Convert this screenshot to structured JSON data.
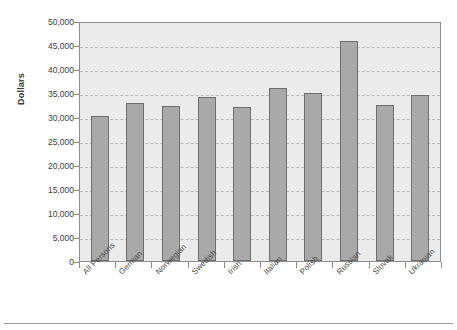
{
  "chart_data": {
    "type": "bar",
    "title": "",
    "subtitle": "",
    "xlabel": "",
    "ylabel": "Dollars",
    "ylim": [
      0,
      50000
    ],
    "ytick_values": [
      0,
      5000,
      10000,
      15000,
      20000,
      25000,
      30000,
      35000,
      40000,
      45000,
      50000
    ],
    "ytick_labels": [
      "0",
      "5,000",
      "10,000",
      "15,000",
      "20,000",
      "25,000",
      "30,000",
      "35,000",
      "40,000",
      "45,000",
      "50,000"
    ],
    "grid": true,
    "grid_style": "dashed-horizontal",
    "legend": null,
    "legend_position": "none",
    "categories": [
      "All Persons",
      "German",
      "Norwegian",
      "Swedish",
      "Irish",
      "Italian",
      "Polish",
      "Russian",
      "Slovak",
      "Ukranian"
    ],
    "values": [
      30300,
      33000,
      32300,
      34200,
      32100,
      36100,
      34900,
      45800,
      32400,
      34600
    ],
    "series": [
      {
        "name": "Dollars",
        "values": [
          30300,
          33000,
          32300,
          34200,
          32100,
          36100,
          34900,
          45800,
          32400,
          34600
        ]
      }
    ],
    "annotations": []
  },
  "style": {
    "bar_fill": "#a9a9a9",
    "bar_border": "#6e6e6e",
    "plot_background": "#ebebeb",
    "plot_border": "#8e8e8e",
    "gridline_color": "#b9b9b9",
    "figure_background": "#fefefe",
    "tick_label_color": "#3f3f3f",
    "axis_title_color": "#3b3b3b"
  }
}
